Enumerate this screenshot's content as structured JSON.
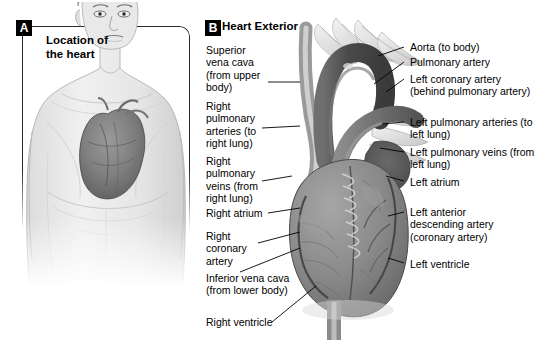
{
  "figure": {
    "panels": [
      {
        "badge": "A",
        "caption": "Location of the heart"
      },
      {
        "badge": "B",
        "title": "Heart Exterior"
      }
    ]
  },
  "labels_left": [
    {
      "id": "superior-vena-cava",
      "text": "Superior vena cava (from upper body)"
    },
    {
      "id": "right-pulmonary-arteries",
      "text": "Right pulmonary arteries (to right lung)"
    },
    {
      "id": "right-pulmonary-veins",
      "text": "Right pulmonary veins (from right lung)"
    },
    {
      "id": "right-atrium",
      "text": "Right atrium"
    },
    {
      "id": "right-coronary-artery",
      "text": "Right coronary artery"
    },
    {
      "id": "inferior-vena-cava",
      "text": "Inferior vena cava (from lower body)"
    },
    {
      "id": "right-ventricle",
      "text": "Right ventricle"
    }
  ],
  "labels_right": [
    {
      "id": "aorta",
      "text": "Aorta (to body)"
    },
    {
      "id": "pulmonary-artery",
      "text": "Pulmonary artery"
    },
    {
      "id": "left-coronary-artery",
      "text": "Left coronary artery (behind pulmonary artery)"
    },
    {
      "id": "left-pulmonary-arteries",
      "text": "Left pulmonary arteries (to left lung)"
    },
    {
      "id": "left-pulmonary-veins",
      "text": "Left pulmonary veins (from left lung)"
    },
    {
      "id": "left-atrium",
      "text": "Left atrium"
    },
    {
      "id": "left-anterior-descending-artery",
      "text": "Left anterior descending artery (coronary artery)"
    },
    {
      "id": "left-ventricle",
      "text": "Left ventricle"
    }
  ],
  "colors": {
    "ink": "#000000",
    "panel_border": "#2b2b2b",
    "skin_light": "#ececec",
    "skin_shade": "#d8d8d8",
    "heart_dark": "#5d5d5d",
    "heart_mid": "#8a8a8a",
    "heart_light": "#b4b4b4",
    "vessel_pale": "#e6e6e6"
  }
}
